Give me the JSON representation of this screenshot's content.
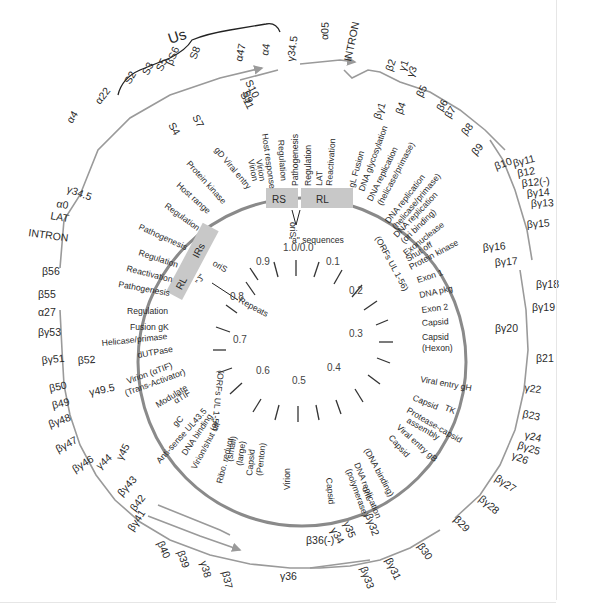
{
  "diagram": {
    "type": "circular-genome-map",
    "colors": {
      "genome_ring": "#8a8a8a",
      "arrow": "#9a9a9a",
      "repeat_box": "#c8c8c8",
      "text": "#2a2a2a"
    },
    "regions": {
      "us_bracket": "Us",
      "RS": "RS",
      "RL_top": "RL",
      "RL_left": "RL",
      "IRS": "IRs"
    },
    "top_annotations": {
      "a_sequences": "\"a\" sequences",
      "oriS_top": "oriS",
      "oriS_left": "oriS",
      "repeats": "Repeats",
      "J": "\"J\"",
      "oriL": "oriL"
    },
    "orf_arcs": {
      "upper_right": "(ORFs UL 1-56)",
      "left": "(ORFs UL 1-56)"
    },
    "map_ticks": [
      "1.0/0.0",
      "0.1",
      "0.2",
      "0.3",
      "0.4",
      "0.5",
      "0.6",
      "0.7",
      "0.8",
      "0.9"
    ],
    "genes": [
      {
        "id": "alpha22",
        "label": "α22"
      },
      {
        "id": "S2",
        "label": "S2"
      },
      {
        "id": "S3",
        "label": "S3"
      },
      {
        "id": "S4",
        "label": "S4"
      },
      {
        "id": "S5",
        "label": "S5"
      },
      {
        "id": "S6",
        "label": "βS6"
      },
      {
        "id": "S7",
        "label": "S7"
      },
      {
        "id": "S8",
        "label": "S8"
      },
      {
        "id": "S9",
        "label": "S9"
      },
      {
        "id": "S10",
        "label": "S10"
      },
      {
        "id": "S11",
        "label": "S11"
      },
      {
        "id": "alpha47",
        "label": "α47"
      },
      {
        "id": "alpha4_top",
        "label": "α4"
      },
      {
        "id": "gamma34_5_top",
        "label": "γ34.5"
      },
      {
        "id": "alpha05",
        "label": "α05"
      },
      {
        "id": "intron_top",
        "label": "INTRON"
      },
      {
        "id": "beta2",
        "label": "β2"
      },
      {
        "id": "gamma1",
        "label": "γ1"
      },
      {
        "id": "gamma3",
        "label": "γ3"
      },
      {
        "id": "betagamma1",
        "label": "βγ1"
      },
      {
        "id": "beta4",
        "label": "β4"
      },
      {
        "id": "beta5",
        "label": "β5"
      },
      {
        "id": "beta6",
        "label": "β6"
      },
      {
        "id": "beta7",
        "label": "β7"
      },
      {
        "id": "beta8",
        "label": "β8"
      },
      {
        "id": "beta9",
        "label": "β9"
      },
      {
        "id": "beta10",
        "label": "β10"
      },
      {
        "id": "betagamma11",
        "label": "βγ11"
      },
      {
        "id": "beta12",
        "label": "β12"
      },
      {
        "id": "beta12m",
        "label": "β12(-)"
      },
      {
        "id": "betagamma14",
        "label": "βγ14"
      },
      {
        "id": "betagamma13",
        "label": "βγ13"
      },
      {
        "id": "betagamma15",
        "label": "βγ15"
      },
      {
        "id": "betagamma16",
        "label": "βγ16"
      },
      {
        "id": "betagamma17",
        "label": "βγ17"
      },
      {
        "id": "betagamma18",
        "label": "βγ18"
      },
      {
        "id": "betagamma19",
        "label": "βγ19"
      },
      {
        "id": "betagamma20",
        "label": "βγ20"
      },
      {
        "id": "beta21",
        "label": "β21"
      },
      {
        "id": "gamma22",
        "label": "γ22"
      },
      {
        "id": "beta23",
        "label": "β23"
      },
      {
        "id": "gamma24",
        "label": "γ24"
      },
      {
        "id": "betagamma25",
        "label": "βγ25"
      },
      {
        "id": "gamma26",
        "label": "γ26"
      },
      {
        "id": "betagamma27",
        "label": "βγ27"
      },
      {
        "id": "betagamma28",
        "label": "βγ28"
      },
      {
        "id": "beta29",
        "label": "β29"
      },
      {
        "id": "beta30",
        "label": "β30"
      },
      {
        "id": "betagamma31",
        "label": "βγ31"
      },
      {
        "id": "betagamma32",
        "label": "βγ32"
      },
      {
        "id": "betagamma33",
        "label": "βγ33"
      },
      {
        "id": "gamma34",
        "label": "γ34"
      },
      {
        "id": "gamma35",
        "label": "γ35"
      },
      {
        "id": "beta36m",
        "label": "β36(-)"
      },
      {
        "id": "gamma36",
        "label": "γ36"
      },
      {
        "id": "beta37",
        "label": "β37"
      },
      {
        "id": "gamma38",
        "label": "γ38"
      },
      {
        "id": "beta39",
        "label": "β39"
      },
      {
        "id": "beta40",
        "label": "β40"
      },
      {
        "id": "betagamma41",
        "label": "βγ41"
      },
      {
        "id": "beta42",
        "label": "β42"
      },
      {
        "id": "betagamma43",
        "label": "βγ43"
      },
      {
        "id": "gamma44",
        "label": "γ44"
      },
      {
        "id": "gamma45",
        "label": "γ45"
      },
      {
        "id": "betagamma46",
        "label": "βγ46"
      },
      {
        "id": "betagamma47",
        "label": "βγ47"
      },
      {
        "id": "betagamma48",
        "label": "βγ48"
      },
      {
        "id": "beta49",
        "label": "β49"
      },
      {
        "id": "gamma49_5",
        "label": "γ49.5"
      },
      {
        "id": "beta50",
        "label": "β50"
      },
      {
        "id": "betagamma51",
        "label": "βγ51"
      },
      {
        "id": "beta52",
        "label": "β52"
      },
      {
        "id": "betagamma53",
        "label": "βγ53"
      },
      {
        "id": "alpha27",
        "label": "α27"
      },
      {
        "id": "beta55",
        "label": "β55"
      },
      {
        "id": "beta56",
        "label": "β56"
      },
      {
        "id": "intron_left",
        "label": "INTRON"
      },
      {
        "id": "lat_left",
        "label": "LAT"
      },
      {
        "id": "alpha0",
        "label": "α0"
      },
      {
        "id": "gamma34_5_left",
        "label": "γ34.5"
      },
      {
        "id": "alpha4_left",
        "label": "α4"
      }
    ],
    "functions": [
      "gD Viral entry",
      "Virion",
      "Virion",
      "Host response",
      "Regulation",
      "Pathogenesis",
      "Regulation",
      "LAT",
      "Reactivation",
      "gL Fusion",
      "DNA glycosylation",
      "DNA replication",
      "(helicase/primase)",
      "DNA replication",
      "(helicase/primase)",
      "DNA replication",
      "(ori binding)",
      "Exonuclease",
      "Shut off",
      "Protein kinase",
      "Exon 1",
      "DNA pkg",
      "Exon 2",
      "Capsid",
      "Capsid",
      "(Hexon)",
      "Viral entry gH",
      "Capsid",
      "TK",
      "Protease-capsid",
      "assembly",
      "Viral entry gB",
      "Capsid",
      "(DNA binding)",
      "DNA replication",
      "(polymerase)",
      "Capsid",
      "Virion",
      "Ribo. reduct",
      "(small)",
      "(large)",
      "Capsid",
      "(Penton)",
      "Virion/shut off",
      "DNA binding",
      "Anti-sense UL43.5",
      "gC",
      "Modulate",
      "αTIF",
      "Virion (αTIF)",
      "(Trans-Activator)",
      "dUTPase",
      "Helicase/primase",
      "Fusion gK",
      "Regulation",
      "Pathogenesis",
      "Reactivation",
      "Regulation",
      "Pathogenesis",
      "Regulation",
      "Host range",
      "Protein kinase"
    ]
  }
}
